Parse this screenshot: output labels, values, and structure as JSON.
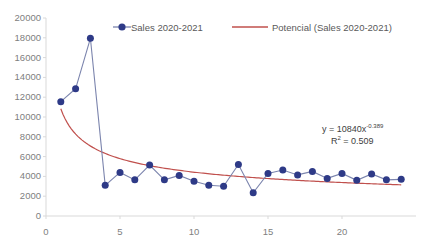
{
  "chart_data": {
    "type": "line",
    "title": "",
    "xlabel": "",
    "ylabel": "",
    "xlim": [
      0,
      25
    ],
    "ylim": [
      0,
      20000
    ],
    "ytick_step": 2000,
    "grid": false,
    "legend_position": "top",
    "x": [
      1,
      2,
      3,
      4,
      5,
      6,
      7,
      8,
      9,
      10,
      11,
      12,
      13,
      14,
      15,
      16,
      17,
      18,
      19,
      20,
      21,
      22,
      23,
      24
    ],
    "xticks": [
      "0",
      "5",
      "10",
      "15",
      "20"
    ],
    "xtick_values": [
      0,
      5,
      10,
      15,
      20
    ],
    "yticks": [
      "0",
      "2000",
      "4000",
      "6000",
      "8000",
      "10000",
      "12000",
      "14000",
      "16000",
      "18000",
      "20000"
    ],
    "ytick_values": [
      0,
      2000,
      4000,
      6000,
      8000,
      10000,
      12000,
      14000,
      16000,
      18000,
      20000
    ],
    "series": [
      {
        "name": "Sales 2020-2021",
        "type": "line-markers",
        "color": "#2e3a87",
        "line_color": "#7b84ad",
        "values": [
          11550,
          12850,
          17950,
          3100,
          4400,
          3650,
          5150,
          3650,
          4100,
          3500,
          3100,
          3000,
          5200,
          2350,
          4300,
          4650,
          4150,
          4500,
          3800,
          4300,
          3600,
          4250,
          3650,
          3700
        ]
      },
      {
        "name": "Potencial (Sales 2020-2021)",
        "type": "trendline-power",
        "color": "#c0504d",
        "coefficient": 10840,
        "exponent": -0.389,
        "r_squared": 0.509
      }
    ],
    "annotations": {
      "equation": "y = 10840x",
      "equation_exponent": "-0.389",
      "r2_label": "R",
      "r2_sup": "2",
      "r2_value": " = 0.509"
    }
  },
  "legend": {
    "series_label": "Sales 2020-2021",
    "trend_label": "Potencial (Sales 2020-2021)"
  },
  "colors": {
    "marker": "#2e3a87",
    "series_line": "#7b84ad",
    "trendline": "#c0504d",
    "axis": "#d9d9d9",
    "tick_text": "#808080"
  }
}
